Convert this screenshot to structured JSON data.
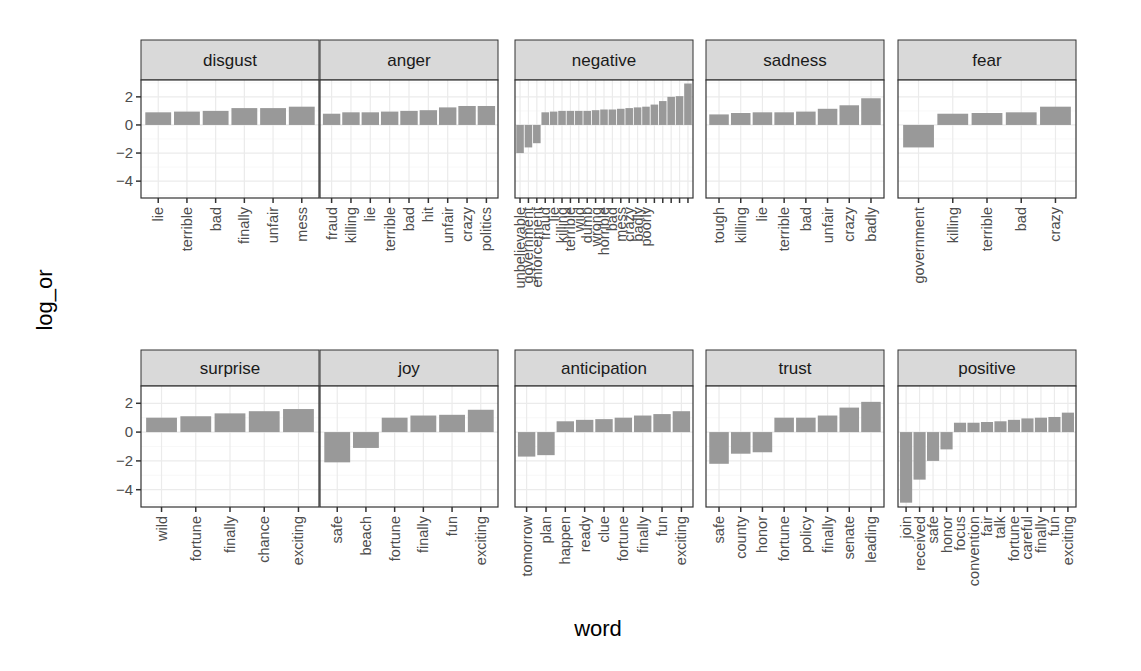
{
  "chart_data": {
    "type": "bar",
    "title": "",
    "xlabel": "word",
    "ylabel": "log_or",
    "ylim": [
      -5.2,
      3.2
    ],
    "yticks": [
      2,
      0,
      -2,
      -4
    ],
    "grid": true,
    "facet_layout": {
      "rows": 2,
      "cols": 5,
      "free_x": true,
      "shared_y": true
    },
    "bar_color": "#999999",
    "strip_fill": "#d9d9d9",
    "panels": [
      {
        "name": "disgust",
        "words": [
          "lie",
          "terrible",
          "bad",
          "finally",
          "unfair",
          "mess"
        ],
        "values": [
          0.9,
          0.95,
          1.0,
          1.2,
          1.2,
          1.3
        ]
      },
      {
        "name": "anger",
        "words": [
          "fraud",
          "killing",
          "lie",
          "terrible",
          "bad",
          "hit",
          "unfair",
          "crazy",
          "politics"
        ],
        "values": [
          0.8,
          0.9,
          0.9,
          0.95,
          1.0,
          1.05,
          1.25,
          1.35,
          1.35
        ]
      },
      {
        "name": "negative",
        "words": [
          "unbelievable",
          "government",
          "enforcement",
          "fraud",
          "lie",
          "killing",
          "terrible",
          "wild",
          "dumb",
          "wrong",
          "horrible",
          "bad",
          "mess",
          "crazy",
          "badly",
          "poorly",
          "",
          "",
          "",
          "",
          ""
        ],
        "values": [
          -2.0,
          -1.6,
          -1.3,
          0.9,
          0.95,
          1.0,
          1.0,
          1.0,
          1.0,
          1.05,
          1.1,
          1.1,
          1.15,
          1.2,
          1.25,
          1.3,
          1.45,
          1.7,
          2.0,
          2.05,
          2.95
        ]
      },
      {
        "name": "sadness",
        "words": [
          "tough",
          "killing",
          "lie",
          "terrible",
          "bad",
          "unfair",
          "crazy",
          "badly"
        ],
        "values": [
          0.75,
          0.85,
          0.9,
          0.9,
          0.95,
          1.15,
          1.4,
          1.9
        ]
      },
      {
        "name": "fear",
        "words": [
          "government",
          "killing",
          "terrible",
          "bad",
          "crazy"
        ],
        "values": [
          -1.6,
          0.8,
          0.85,
          0.9,
          1.3
        ]
      },
      {
        "name": "surprise",
        "words": [
          "wild",
          "fortune",
          "finally",
          "chance",
          "exciting"
        ],
        "values": [
          1.0,
          1.1,
          1.3,
          1.45,
          1.6
        ]
      },
      {
        "name": "joy",
        "words": [
          "safe",
          "beach",
          "fortune",
          "finally",
          "fun",
          "exciting"
        ],
        "values": [
          -2.1,
          -1.1,
          1.0,
          1.15,
          1.2,
          1.55
        ]
      },
      {
        "name": "anticipation",
        "words": [
          "tomorrow",
          "plan",
          "happen",
          "ready",
          "clue",
          "fortune",
          "finally",
          "fun",
          "exciting"
        ],
        "values": [
          -1.7,
          -1.6,
          0.75,
          0.85,
          0.9,
          1.0,
          1.15,
          1.25,
          1.45
        ]
      },
      {
        "name": "trust",
        "words": [
          "safe",
          "county",
          "honor",
          "fortune",
          "policy",
          "finally",
          "senate",
          "leading"
        ],
        "values": [
          -2.2,
          -1.5,
          -1.4,
          1.0,
          1.0,
          1.15,
          1.7,
          2.1
        ]
      },
      {
        "name": "positive",
        "words": [
          "join",
          "received",
          "safe",
          "honor",
          "focus",
          "convention",
          "fair",
          "talk",
          "fortune",
          "careful",
          "finally",
          "fun",
          "exciting"
        ],
        "values": [
          -4.9,
          -3.3,
          -2.0,
          -1.2,
          0.65,
          0.65,
          0.7,
          0.75,
          0.85,
          0.95,
          1.0,
          1.05,
          1.35
        ]
      }
    ]
  },
  "axes": {
    "ylabel": "log_or",
    "xlabel": "word"
  }
}
